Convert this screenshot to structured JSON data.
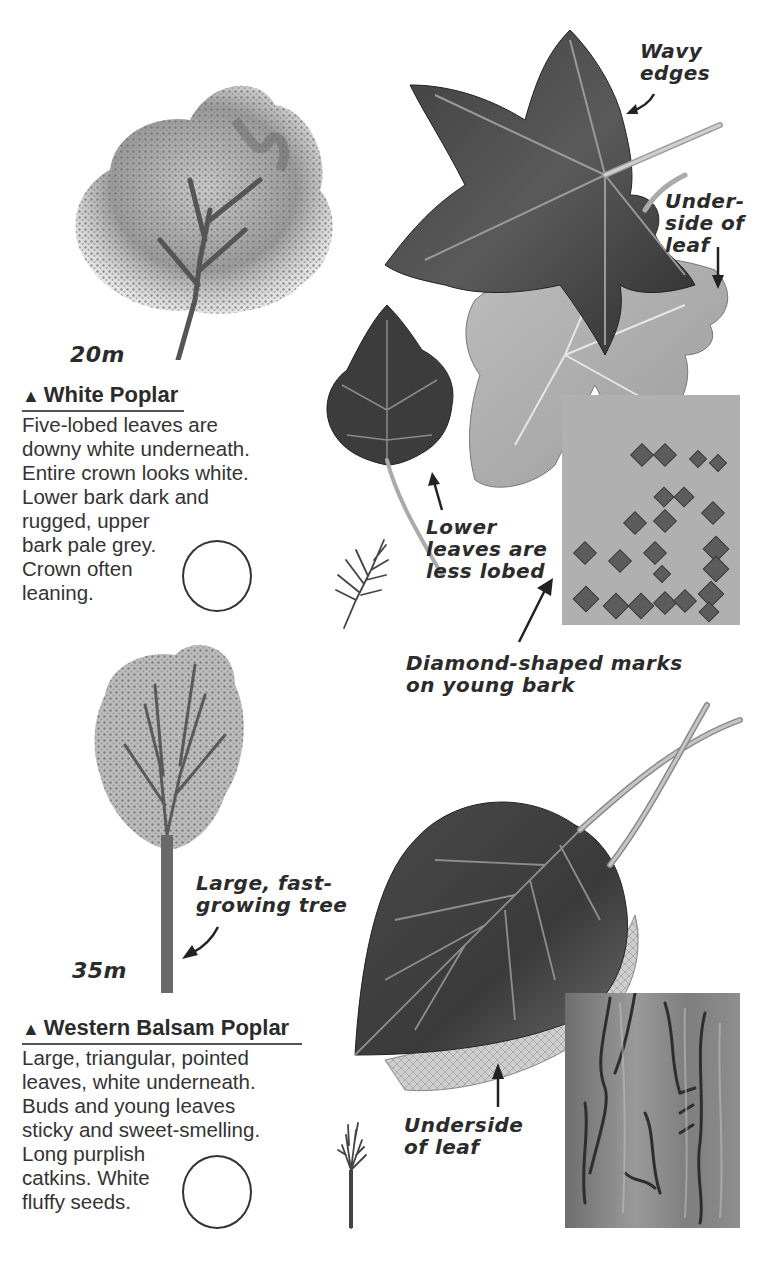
{
  "page": {
    "background": "#ffffff",
    "text_color": "#2b2b2b"
  },
  "white_poplar": {
    "height_label": "20m",
    "title_marker": "▲",
    "title": "White Poplar",
    "description_lines": [
      "Five-lobed leaves are",
      "downy white underneath.",
      "Entire crown looks white.",
      "Lower bark dark and",
      "rugged, upper",
      "bark pale grey.",
      "Crown often",
      "leaning."
    ],
    "annotations": {
      "wavy_edges": [
        "Wavy",
        "edges"
      ],
      "underside": [
        "Under-",
        "side of",
        "leaf"
      ],
      "lower_leaves": [
        "Lower",
        "leaves are",
        "less lobed"
      ],
      "diamond_marks": [
        "Diamond-shaped marks",
        "on young bark"
      ]
    }
  },
  "western_balsam_poplar": {
    "height_label": "35m",
    "title_marker": "▲",
    "title": "Western Balsam Poplar",
    "description_lines": [
      "Large, triangular, pointed",
      "leaves, white underneath.",
      "Buds and young leaves",
      "sticky and sweet-smelling.",
      "Long purplish",
      "catkins. White",
      "fluffy seeds."
    ],
    "annotations": {
      "tree_note": [
        "Large, fast-",
        "growing tree"
      ],
      "underside": [
        "Underside",
        "of leaf"
      ]
    }
  },
  "icons": {
    "tick_circle": "empty-checkbox-circle",
    "triangle": "conifer-broadleaf-marker"
  }
}
